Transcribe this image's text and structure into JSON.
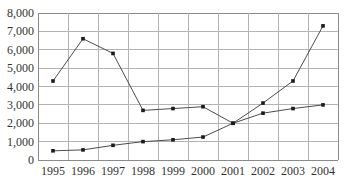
{
  "chart_data": {
    "type": "line",
    "title": "",
    "xlabel": "",
    "ylabel": "",
    "x": [
      "1995",
      "1996",
      "1997",
      "1998",
      "1999",
      "2000",
      "2001",
      "2002",
      "2003",
      "2004"
    ],
    "series": [
      {
        "name": "series-1-declining",
        "values": [
          4300,
          6600,
          5800,
          2700,
          2800,
          2900,
          2000,
          2550,
          2800,
          3000
        ]
      },
      {
        "name": "series-2-rising",
        "values": [
          500,
          550,
          800,
          1000,
          1100,
          1250,
          2000,
          3100,
          4300,
          7300
        ]
      }
    ],
    "ylim": [
      0,
      8000
    ],
    "ytick_step": 1000,
    "ytick_labels": [
      "0",
      "1,000",
      "2,000",
      "3,000",
      "4,000",
      "5,000",
      "6,000",
      "7,000",
      "8,000"
    ],
    "grid": true,
    "legend_position": "none",
    "marker": "square",
    "colors": {
      "grid": "#b3b3b3",
      "border": "#8a8a8a",
      "line": "#4d4d4d",
      "marker": "#1a1a1a",
      "text": "#333333",
      "background": "#ffffff"
    }
  }
}
